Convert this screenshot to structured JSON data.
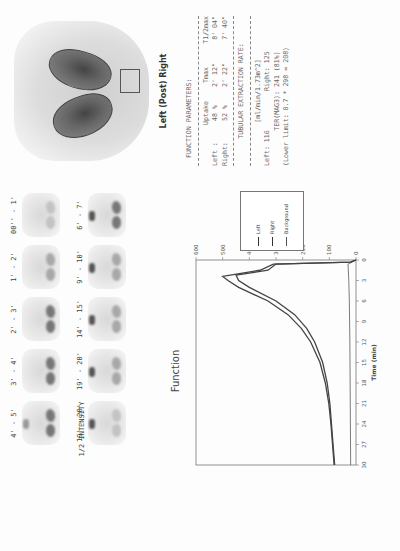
{
  "thumbnails": {
    "frames": [
      {
        "label": "00'' - 1'",
        "intensity": "vfaint",
        "bladder": false
      },
      {
        "label": "1' - 2'",
        "intensity": "faint",
        "bladder": false
      },
      {
        "label": "2' - 3'",
        "intensity": "normal",
        "bladder": false
      },
      {
        "label": "3' - 4'",
        "intensity": "normal",
        "bladder": false
      },
      {
        "label": "4' - 5'",
        "intensity": "normal",
        "bladder": true
      },
      {
        "label": "6' - 7'",
        "intensity": "normal",
        "bladder": true
      },
      {
        "label": "9' - 10'",
        "intensity": "faint",
        "bladder": true
      },
      {
        "label": "14' - 15'",
        "intensity": "faint",
        "bladder": true
      },
      {
        "label": "19' - 20'",
        "intensity": "faint",
        "bladder": true
      },
      {
        "label": "19' - 20'",
        "intensity": "vfaint",
        "bladder": true
      }
    ],
    "half_intensity_label": "1/2 INTENSITY"
  },
  "kidney_image": {
    "caption": "Left (Post) Right"
  },
  "function_parameters": {
    "title": "FUNCTION PARAMETERS:",
    "headers": [
      "",
      "Uptake",
      "Tmax",
      "T1/2max"
    ],
    "rows": [
      [
        "Left :",
        "48 %",
        "2' 12\"",
        "8' 04\""
      ],
      [
        "Right:",
        "52 %",
        "2' 22\"",
        "7' 40\""
      ]
    ],
    "ter_title": "TUBULAR EXTRACTION RATE:",
    "ter_unit": "[ml/min/1.73m^2]",
    "ter_left": "Left:  116",
    "ter_right": "Right: 125",
    "ter_mag3": "TER(MAG3): 241  (81%)",
    "ter_lower": "(Lower limit: 0.7 * 298 = 208)"
  },
  "chart_data": {
    "type": "line",
    "title": "Function",
    "xlabel": "Time (min)",
    "ylabel": "Count Rate (cpm/MBq)",
    "xlim": [
      0,
      30
    ],
    "ylim": [
      0,
      600
    ],
    "xticks": [
      0,
      3,
      6,
      9,
      12,
      15,
      18,
      21,
      24,
      27,
      30
    ],
    "yticks": [
      0,
      100,
      200,
      300,
      400,
      500,
      600
    ],
    "grid": false,
    "legend_position": "upper right, outside",
    "series": [
      {
        "name": "Left",
        "x": [
          0,
          0.3,
          0.6,
          1.5,
          2.2,
          3,
          4,
          6,
          8,
          10,
          12,
          15,
          18,
          21,
          24,
          27,
          30
        ],
        "values": [
          0,
          20,
          300,
          330,
          450,
          440,
          400,
          300,
          230,
          185,
          155,
          125,
          108,
          98,
          92,
          86,
          80
        ]
      },
      {
        "name": "Right",
        "x": [
          0,
          0.3,
          0.6,
          1.5,
          2.4,
          3,
          4,
          6,
          8,
          10,
          12,
          15,
          18,
          21,
          24,
          27,
          30
        ],
        "values": [
          0,
          20,
          310,
          360,
          500,
          480,
          440,
          330,
          255,
          205,
          170,
          135,
          115,
          102,
          94,
          88,
          82
        ]
      },
      {
        "name": "Background",
        "x": [
          0,
          0.3,
          0.6,
          3,
          6,
          12,
          18,
          24,
          30
        ],
        "values": [
          0,
          15,
          30,
          27,
          25,
          23,
          22,
          21,
          20
        ]
      }
    ]
  },
  "legend": {
    "items": [
      "Left",
      "Right",
      "Background"
    ]
  }
}
